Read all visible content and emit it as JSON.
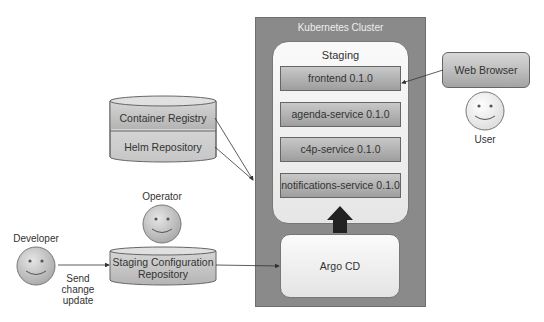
{
  "cluster": {
    "title": "Kubernetes Cluster"
  },
  "staging": {
    "title": "Staging",
    "services": [
      {
        "label": "frontend 0.1.0"
      },
      {
        "label": "agenda-service 0.1.0"
      },
      {
        "label": "c4p-service 0.1.0"
      },
      {
        "label": "notifications-service 0.1.0"
      }
    ]
  },
  "argo": {
    "label": "Argo CD"
  },
  "registries": {
    "container": "Container Registry",
    "helm": "Helm Repository"
  },
  "config_repo": {
    "line1": "Staging Configuration",
    "line2": "Repository"
  },
  "actors": {
    "developer": "Developer",
    "operator": "Operator",
    "user": "User"
  },
  "browser": {
    "label": "Web Browser"
  },
  "edge_labels": {
    "send_line1": "Send",
    "send_line2": "change",
    "send_line3": "update"
  },
  "colors": {
    "cluster": "#8a8a8a",
    "service": "#b0b0b0",
    "arrow": "#222222",
    "face": "#c0c0c0"
  }
}
